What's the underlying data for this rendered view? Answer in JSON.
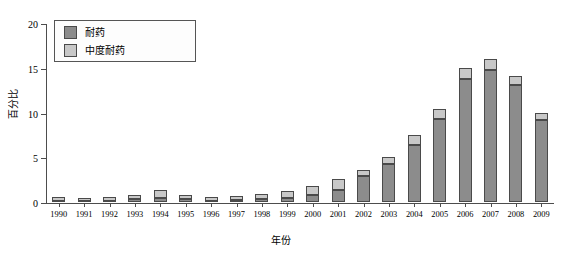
{
  "chart_data": {
    "type": "bar",
    "stacked": true,
    "title": "",
    "xlabel": "年份",
    "ylabel": "百分比",
    "ylim": [
      0,
      20
    ],
    "yticks": [
      0,
      5,
      10,
      15,
      20
    ],
    "grid": false,
    "legend_position": "top-left",
    "categories": [
      "1990",
      "1991",
      "1992",
      "1993",
      "1994",
      "1995",
      "1996",
      "1997",
      "1998",
      "1999",
      "2000",
      "2001",
      "2002",
      "2003",
      "2004",
      "2005",
      "2006",
      "2007",
      "2008",
      "2009"
    ],
    "series": [
      {
        "name": "耐药",
        "color": "#8c8c8c",
        "values": [
          0.1,
          0.1,
          0.15,
          0.3,
          0.5,
          0.3,
          0.15,
          0.2,
          0.3,
          0.5,
          0.8,
          1.3,
          2.9,
          4.2,
          6.4,
          9.3,
          13.8,
          14.7,
          13.1,
          9.2
        ]
      },
      {
        "name": "中度耐药",
        "color": "#c8c8c8",
        "values": [
          0.5,
          0.35,
          0.4,
          0.5,
          0.8,
          0.5,
          0.4,
          0.5,
          0.6,
          0.7,
          1.0,
          1.3,
          0.7,
          0.8,
          1.1,
          1.1,
          1.2,
          1.3,
          1.0,
          0.8
        ]
      }
    ],
    "totals": [
      0.6,
      0.45,
      0.55,
      0.8,
      1.3,
      0.8,
      0.55,
      0.7,
      0.9,
      1.2,
      1.8,
      2.6,
      3.6,
      5.0,
      7.5,
      10.4,
      15.0,
      16.0,
      14.1,
      10.0
    ]
  },
  "legend": {
    "items": [
      {
        "label": "耐药"
      },
      {
        "label": "中度耐药"
      }
    ]
  }
}
